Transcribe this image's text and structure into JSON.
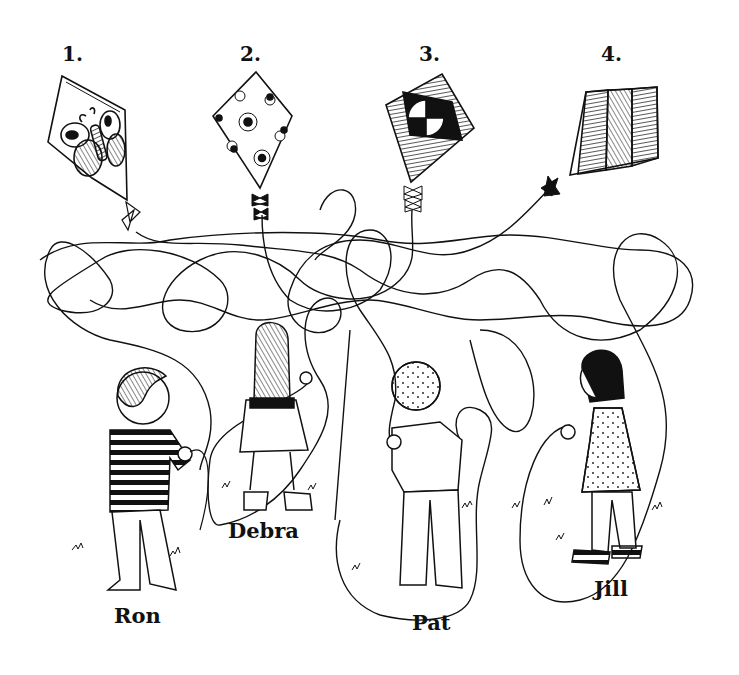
{
  "puzzle": {
    "kites": [
      {
        "number": "1.",
        "pattern": "butterfly"
      },
      {
        "number": "2.",
        "pattern": "flowers"
      },
      {
        "number": "3.",
        "pattern": "checkered-circle"
      },
      {
        "number": "4.",
        "pattern": "striped"
      }
    ],
    "children": [
      {
        "name": "Ron"
      },
      {
        "name": "Debra"
      },
      {
        "name": "Pat"
      },
      {
        "name": "Jill"
      }
    ]
  },
  "colors": {
    "ink": "#111111",
    "paper": "#ffffff"
  }
}
